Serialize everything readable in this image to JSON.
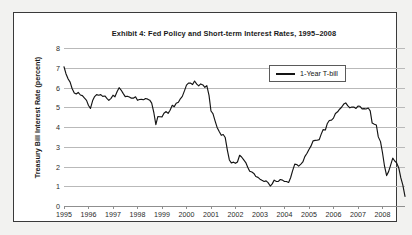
{
  "figure": {
    "title": "Exhibit 4: Fed Policy and Short-term Interest Rates, 1995–2008",
    "y_axis_title": "Treasury Bill Interest Rate (percent)",
    "legend_label": "1-Year T-bill",
    "line_color": "#141414",
    "grid_color": "#b9b9b9",
    "background_color": "#ffffff"
  },
  "chart_data": {
    "type": "line",
    "title": "Exhibit 4: Fed Policy and Short-term Interest Rates, 1995–2008",
    "xlabel": "",
    "ylabel": "Treasury Bill Interest Rate (percent)",
    "xlim": [
      1995.0,
      2008.92
    ],
    "ylim": [
      0,
      8
    ],
    "yticks": [
      0,
      1,
      2,
      3,
      4,
      5,
      6,
      7,
      8
    ],
    "xticks": [
      1995,
      1996,
      1997,
      1998,
      1999,
      2000,
      2001,
      2002,
      2003,
      2004,
      2005,
      2006,
      2007,
      2008
    ],
    "xtick_labels": [
      "1995",
      "1996",
      "1997",
      "1998",
      "1999",
      "2000",
      "2001",
      "2002",
      "2003",
      "2004",
      "2005",
      "2006",
      "2007",
      "2008"
    ],
    "grid": "horizontal",
    "legend_position": "upper right",
    "series": [
      {
        "name": "1-Year T-bill",
        "color": "#141414",
        "x": [
          1995.0,
          1995.08,
          1995.17,
          1995.25,
          1995.33,
          1995.42,
          1995.5,
          1995.58,
          1995.67,
          1995.75,
          1995.83,
          1995.92,
          1996.0,
          1996.08,
          1996.17,
          1996.25,
          1996.33,
          1996.42,
          1996.5,
          1996.58,
          1996.67,
          1996.75,
          1996.83,
          1996.92,
          1997.0,
          1997.08,
          1997.17,
          1997.25,
          1997.33,
          1997.42,
          1997.5,
          1997.58,
          1997.67,
          1997.75,
          1997.83,
          1997.92,
          1998.0,
          1998.08,
          1998.17,
          1998.25,
          1998.33,
          1998.42,
          1998.5,
          1998.58,
          1998.67,
          1998.75,
          1998.83,
          1998.92,
          1999.0,
          1999.08,
          1999.17,
          1999.25,
          1999.33,
          1999.42,
          1999.5,
          1999.58,
          1999.67,
          1999.75,
          1999.83,
          1999.92,
          2000.0,
          2000.08,
          2000.17,
          2000.25,
          2000.33,
          2000.42,
          2000.5,
          2000.58,
          2000.67,
          2000.75,
          2000.83,
          2000.92,
          2001.0,
          2001.08,
          2001.17,
          2001.25,
          2001.33,
          2001.42,
          2001.5,
          2001.58,
          2001.67,
          2001.75,
          2001.83,
          2001.92,
          2002.0,
          2002.08,
          2002.17,
          2002.25,
          2002.33,
          2002.42,
          2002.5,
          2002.58,
          2002.67,
          2002.75,
          2002.83,
          2002.92,
          2003.0,
          2003.08,
          2003.17,
          2003.25,
          2003.33,
          2003.42,
          2003.5,
          2003.58,
          2003.67,
          2003.75,
          2003.83,
          2003.92,
          2004.0,
          2004.08,
          2004.17,
          2004.25,
          2004.33,
          2004.42,
          2004.5,
          2004.58,
          2004.67,
          2004.75,
          2004.83,
          2004.92,
          2005.0,
          2005.08,
          2005.17,
          2005.25,
          2005.33,
          2005.42,
          2005.5,
          2005.58,
          2005.67,
          2005.75,
          2005.83,
          2005.92,
          2006.0,
          2006.08,
          2006.17,
          2006.25,
          2006.33,
          2006.42,
          2006.5,
          2006.58,
          2006.67,
          2006.75,
          2006.83,
          2006.92,
          2007.0,
          2007.08,
          2007.17,
          2007.25,
          2007.33,
          2007.42,
          2007.5,
          2007.58,
          2007.67,
          2007.75,
          2007.83,
          2007.92,
          2008.0,
          2008.08,
          2008.17,
          2008.25,
          2008.33,
          2008.42,
          2008.5,
          2008.58,
          2008.67,
          2008.75,
          2008.83,
          2008.92
        ],
        "y": [
          7.05,
          6.7,
          6.43,
          6.27,
          5.95,
          5.72,
          5.67,
          5.75,
          5.62,
          5.59,
          5.47,
          5.35,
          5.09,
          4.94,
          5.34,
          5.54,
          5.64,
          5.61,
          5.64,
          5.55,
          5.57,
          5.45,
          5.35,
          5.45,
          5.61,
          5.53,
          5.8,
          5.99,
          5.87,
          5.69,
          5.54,
          5.56,
          5.52,
          5.46,
          5.46,
          5.53,
          5.35,
          5.39,
          5.4,
          5.38,
          5.44,
          5.41,
          5.36,
          5.21,
          4.71,
          4.12,
          4.53,
          4.52,
          4.51,
          4.7,
          4.78,
          4.69,
          4.85,
          5.1,
          5.03,
          5.2,
          5.25,
          5.43,
          5.55,
          5.84,
          6.12,
          6.22,
          6.22,
          6.15,
          6.33,
          6.17,
          6.08,
          6.18,
          6.13,
          6.01,
          6.09,
          5.6,
          4.81,
          4.68,
          4.3,
          3.98,
          3.78,
          3.58,
          3.62,
          3.47,
          2.82,
          2.33,
          2.18,
          2.22,
          2.16,
          2.23,
          2.57,
          2.48,
          2.35,
          2.2,
          1.96,
          1.76,
          1.72,
          1.65,
          1.49,
          1.45,
          1.36,
          1.3,
          1.24,
          1.27,
          1.18,
          1.01,
          1.12,
          1.31,
          1.24,
          1.25,
          1.34,
          1.31,
          1.24,
          1.24,
          1.19,
          1.43,
          1.78,
          2.12,
          2.1,
          2.02,
          2.12,
          2.23,
          2.5,
          2.67,
          2.86,
          3.03,
          3.3,
          3.32,
          3.33,
          3.36,
          3.64,
          3.87,
          3.85,
          4.18,
          4.33,
          4.35,
          4.45,
          4.68,
          4.77,
          4.9,
          5.0,
          5.16,
          5.22,
          5.08,
          4.97,
          5.01,
          5.01,
          4.94,
          5.06,
          5.05,
          4.92,
          4.93,
          4.91,
          4.96,
          4.82,
          4.2,
          4.14,
          4.1,
          3.5,
          3.26,
          2.71,
          2.05,
          1.54,
          1.74,
          2.06,
          2.42,
          2.28,
          2.18,
          1.91,
          1.42,
          1.07,
          0.49
        ]
      }
    ]
  }
}
